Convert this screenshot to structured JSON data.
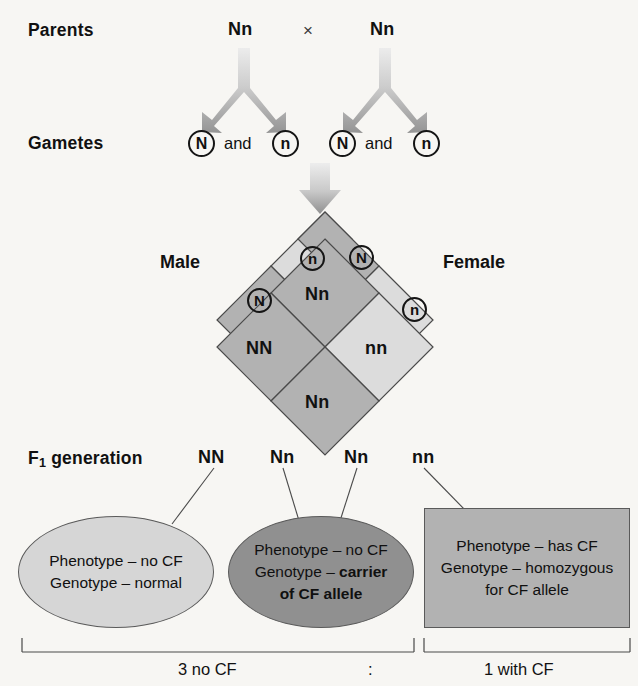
{
  "figure": {
    "background_color": "#f7f6f3"
  },
  "rows": {
    "parents": {
      "label": "Parents",
      "male_genotype": "Nn",
      "cross_symbol": "×",
      "female_genotype": "Nn"
    },
    "gametes": {
      "label": "Gametes",
      "conjunction": "and",
      "male_alleles": [
        "N",
        "n"
      ],
      "female_alleles": [
        "N",
        "n"
      ]
    },
    "f1": {
      "label_prefix": "F",
      "label_subscript": "1",
      "label_suffix": " generation",
      "genotypes": [
        "NN",
        "Nn",
        "Nn",
        "nn"
      ]
    }
  },
  "punnett": {
    "male_label": "Male",
    "female_label": "Female",
    "male_gamete_top": "n",
    "male_gamete_left": "N",
    "female_gamete_top": "N",
    "female_gamete_right": "n",
    "cells": [
      {
        "id": "top",
        "genotype": "Nn",
        "fill": "#b2b2b2"
      },
      {
        "id": "left",
        "genotype": "NN",
        "fill": "#b2b2b2"
      },
      {
        "id": "right",
        "genotype": "nn",
        "fill": "#dcdcdc"
      },
      {
        "id": "bottom",
        "genotype": "Nn",
        "fill": "#b2b2b2"
      }
    ],
    "corner_fill_light": "#dcdcdc",
    "corner_fill_mid": "#b2b2b2",
    "stroke": "#4a4a4a"
  },
  "outcomes": [
    {
      "shape": "ellipse",
      "fill": "#d6d6d6",
      "lines": [
        {
          "text": "Phenotype – no CF",
          "bold_tail": ""
        },
        {
          "text": "Genotype – normal",
          "bold_tail": ""
        }
      ]
    },
    {
      "shape": "ellipse",
      "fill": "#909090",
      "lines": [
        {
          "text": "Phenotype – no CF",
          "bold_tail": ""
        },
        {
          "text": "Genotype – ",
          "bold_tail": "carrier"
        },
        {
          "text": "",
          "bold_tail": "of CF allele"
        }
      ]
    },
    {
      "shape": "rect",
      "fill": "#b2b2b2",
      "lines": [
        {
          "text": "Phenotype – has CF",
          "bold_tail": ""
        },
        {
          "text": "Genotype – homozygous",
          "bold_tail": ""
        },
        {
          "text": "for CF allele",
          "bold_tail": ""
        }
      ]
    }
  ],
  "ratio": {
    "left_text": "3 no CF",
    "separator": ":",
    "right_text": "1 with CF"
  },
  "colors": {
    "arrow_light": "#e3e3e3",
    "arrow_dark": "#9a9a9a",
    "outline": "#5a5a5a",
    "text": "#111111"
  }
}
